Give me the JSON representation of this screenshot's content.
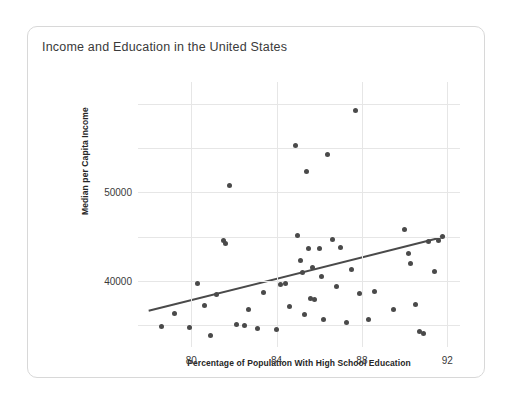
{
  "card": {
    "title": "Income and Education in the United States"
  },
  "chart_data": {
    "type": "scatter",
    "title": "Income and Education in the United States",
    "xlabel": "Percentage of Population With High School Education",
    "ylabel": "Median per Capita Income",
    "xlim": [
      77.5,
      92.6
    ],
    "ylim": [
      32500,
      62500
    ],
    "xticks": [
      80,
      84,
      88,
      92
    ],
    "xtick_labels": [
      "80",
      "84",
      "88",
      "92"
    ],
    "yticks": [
      40000,
      50000
    ],
    "ytick_labels": [
      "40000",
      "50000"
    ],
    "grid": true,
    "legend": "none",
    "point_color": "#4a4a4a",
    "trend_color": "#4a4a4a",
    "points": [
      {
        "x": 78.6,
        "y": 34800
      },
      {
        "x": 79.2,
        "y": 36300
      },
      {
        "x": 79.9,
        "y": 34700
      },
      {
        "x": 80.3,
        "y": 39700
      },
      {
        "x": 80.6,
        "y": 37200
      },
      {
        "x": 80.9,
        "y": 33800
      },
      {
        "x": 81.2,
        "y": 38500
      },
      {
        "x": 81.5,
        "y": 44600
      },
      {
        "x": 81.6,
        "y": 44200
      },
      {
        "x": 81.8,
        "y": 50800
      },
      {
        "x": 82.1,
        "y": 35100
      },
      {
        "x": 82.5,
        "y": 34900
      },
      {
        "x": 82.7,
        "y": 36800
      },
      {
        "x": 83.1,
        "y": 34600
      },
      {
        "x": 83.4,
        "y": 38700
      },
      {
        "x": 84.0,
        "y": 34500
      },
      {
        "x": 84.2,
        "y": 39600
      },
      {
        "x": 84.4,
        "y": 39700
      },
      {
        "x": 84.6,
        "y": 37100
      },
      {
        "x": 84.9,
        "y": 55300
      },
      {
        "x": 85.0,
        "y": 45100
      },
      {
        "x": 85.1,
        "y": 42300
      },
      {
        "x": 85.2,
        "y": 40900
      },
      {
        "x": 85.3,
        "y": 36200
      },
      {
        "x": 85.4,
        "y": 52400
      },
      {
        "x": 85.5,
        "y": 43600
      },
      {
        "x": 85.6,
        "y": 38000
      },
      {
        "x": 85.7,
        "y": 41500
      },
      {
        "x": 85.8,
        "y": 37900
      },
      {
        "x": 86.0,
        "y": 43700
      },
      {
        "x": 86.1,
        "y": 40500
      },
      {
        "x": 86.2,
        "y": 35600
      },
      {
        "x": 86.4,
        "y": 54300
      },
      {
        "x": 86.6,
        "y": 44700
      },
      {
        "x": 86.8,
        "y": 39400
      },
      {
        "x": 87.0,
        "y": 43800
      },
      {
        "x": 87.3,
        "y": 35300
      },
      {
        "x": 87.5,
        "y": 41300
      },
      {
        "x": 87.7,
        "y": 59300
      },
      {
        "x": 87.9,
        "y": 38600
      },
      {
        "x": 88.3,
        "y": 35600
      },
      {
        "x": 88.6,
        "y": 38800
      },
      {
        "x": 89.5,
        "y": 36800
      },
      {
        "x": 90.0,
        "y": 45800
      },
      {
        "x": 90.2,
        "y": 43100
      },
      {
        "x": 90.3,
        "y": 41900
      },
      {
        "x": 90.5,
        "y": 37300
      },
      {
        "x": 90.7,
        "y": 34200
      },
      {
        "x": 90.9,
        "y": 34000
      },
      {
        "x": 91.1,
        "y": 44500
      },
      {
        "x": 91.4,
        "y": 41000
      },
      {
        "x": 91.6,
        "y": 44600
      },
      {
        "x": 91.8,
        "y": 45000
      }
    ],
    "trendline": {
      "x1": 78.0,
      "y1": 36600,
      "x2": 91.9,
      "y2": 45000
    }
  }
}
